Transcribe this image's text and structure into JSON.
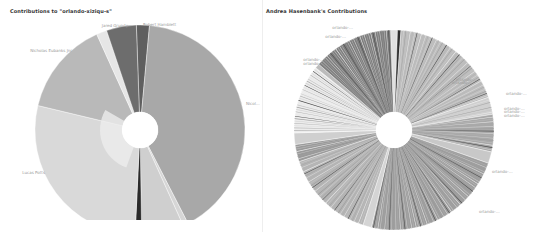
{
  "left_chart": {
    "title": "Contributions to \"orlando-xiziqu-s\""
  },
  "right_chart": {
    "title": "Andrea Hasenbank's Contributions"
  },
  "chart_data": [
    {
      "type": "pie",
      "title": "Contributions to \"orlando-xiziqu-s\"",
      "donut": true,
      "center": [
        140,
        130
      ],
      "outer_radius": 105,
      "inner_radius": 18,
      "slices": [
        {
          "label": "Robert Hamblett",
          "value": 2.0,
          "color": "#5f5f5f"
        },
        {
          "label": "(right-label, illegible)",
          "value": 41.0,
          "color": "#a8a8a8"
        },
        {
          "label": "",
          "value": 0.8,
          "color": "#d6d6d6"
        },
        {
          "label": "",
          "value": 6.5,
          "color": "#cfcfcf"
        },
        {
          "label": "",
          "value": 1.0,
          "color": "#2a2a2a"
        },
        {
          "label": "Lucas Potts",
          "value": 28.0,
          "color": "#d9d9d9"
        },
        {
          "label": "Nicholas Eubanks Jnr",
          "value": 14.5,
          "color": "#b9b9b9"
        },
        {
          "label": "",
          "value": 1.6,
          "color": "#e6e6e6"
        },
        {
          "label": "Jared Grundy",
          "value": 4.6,
          "color": "#6d6d6d"
        }
      ],
      "inner_ring": [
        {
          "label": "",
          "start_deg": 200,
          "end_deg": 300,
          "color": "#ececec"
        }
      ]
    },
    {
      "type": "pie",
      "title": "Andrea Hasenbank's Contributions",
      "donut": true,
      "center": [
        393,
        130
      ],
      "outer_radius": 100,
      "inner_radius": 18,
      "slices_note": "many thin slices labelled 'orlando-…'; labels illegible",
      "slices": [
        {
          "label": "orlando-…",
          "value": 1.2,
          "color": "#e0e0e0"
        },
        {
          "label": "orlando-…",
          "value": 0.6,
          "color": "#2e2e2e"
        },
        {
          "label": "orlando-… (fan of thin slices)",
          "value": 20.0,
          "color": "#bdbdbd"
        },
        {
          "label": "orlando-…",
          "value": 3.0,
          "color": "#d0d0d0"
        },
        {
          "label": "orlando-…",
          "value": 6.5,
          "color": "#a9a9a9"
        },
        {
          "label": "orlando-…",
          "value": 2.0,
          "color": "#c8c8c8"
        },
        {
          "label": "orlando-…",
          "value": 25.0,
          "color": "#9e9e9e"
        },
        {
          "label": "orlando-…",
          "value": 1.5,
          "color": "#d4d4d4"
        },
        {
          "label": "orlando-… (fan of thin slices)",
          "value": 16.0,
          "color": "#b5b5b5"
        },
        {
          "label": "orlando-…",
          "value": 3.0,
          "color": "#9a9a9a"
        },
        {
          "label": "orlando-…",
          "value": 2.0,
          "color": "#cfcfcf"
        },
        {
          "label": "orlando-…",
          "value": 12.0,
          "color": "#ececec"
        },
        {
          "label": "orlando-…",
          "value": 0.8,
          "color": "#bbbbbb"
        },
        {
          "label": "orlando-…",
          "value": 14.0,
          "color": "#7e7e7e"
        }
      ]
    }
  ]
}
